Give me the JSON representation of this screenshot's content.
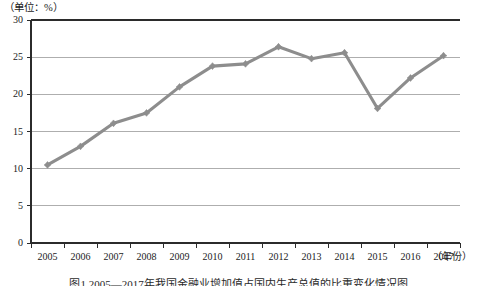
{
  "figure": {
    "unit_caption": "（单位：%）",
    "xaxis_unit_label": "（年份）",
    "bottom_caption": "图1  2005—2017年我国金融业增加值占国内生产总值的比重变化情况图"
  },
  "chart_data": {
    "type": "line",
    "title": "",
    "subtitle": "",
    "xlabel": "（年份）",
    "ylabel": "（单位：%）",
    "categories": [
      "2005",
      "2006",
      "2007",
      "2008",
      "2009",
      "2010",
      "2011",
      "2012",
      "2013",
      "2014",
      "2015",
      "2016",
      "2017"
    ],
    "values": [
      10.5,
      13.0,
      16.1,
      17.5,
      21.0,
      23.8,
      24.1,
      26.4,
      24.8,
      25.6,
      18.1,
      22.2,
      25.2
    ],
    "yticks": [
      0,
      5,
      10,
      15,
      20,
      25,
      30
    ],
    "ylim": [
      0,
      30
    ],
    "xlim": [
      "2005",
      "2017"
    ],
    "grid": true,
    "grid_axis": "y",
    "legend": false,
    "legend_position": "none",
    "series": [
      {
        "name": "占比",
        "color": "#8d8d8d",
        "marker": "diamond",
        "values": [
          10.5,
          13.0,
          16.1,
          17.5,
          21.0,
          23.8,
          24.1,
          26.4,
          24.8,
          25.6,
          18.1,
          22.2,
          25.2
        ]
      }
    ],
    "colors": {
      "line": "#8d8d8d",
      "grid": "#9a9a9a",
      "axis": "#2b2b2b",
      "background": "#ffffff",
      "text": "#1b1b1b"
    }
  }
}
